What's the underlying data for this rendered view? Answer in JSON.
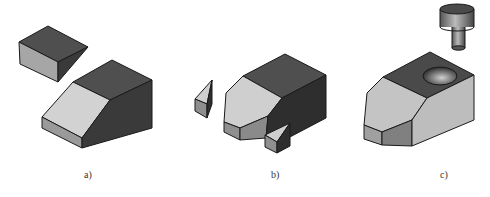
{
  "figure": {
    "labels": {
      "a": "a)",
      "b": "b)",
      "c": "c)"
    },
    "colors": {
      "top": "#4f4f4f",
      "side_dark": "#3a3a3a",
      "light": "#cfcfcf",
      "mid": "#9a9a9a",
      "edge": "#1a1a1a"
    }
  }
}
